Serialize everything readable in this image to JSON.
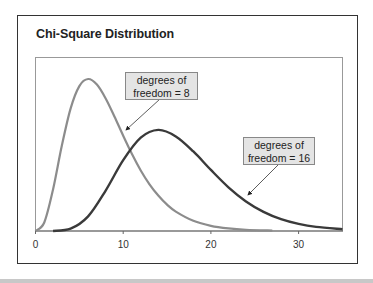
{
  "figure": {
    "title": "Chi-Square Distribution"
  },
  "callouts": [
    {
      "line1": "degrees of",
      "line2": "freedom = 8"
    },
    {
      "line1": "degrees of",
      "line2": "freedom = 16"
    }
  ],
  "colors": {
    "df8_line": "#8c8c8c",
    "df16_line": "#3a3a3a",
    "callout_bg": "#e4e4e4",
    "axis": "#666666"
  },
  "chart_data": {
    "type": "line",
    "title": "Chi-Square Distribution",
    "xlabel": "",
    "ylabel": "",
    "xlim": [
      0,
      35
    ],
    "x_ticks": [
      0,
      10,
      20,
      30
    ],
    "x_tick_labels": [
      "0",
      "10",
      "20",
      "30"
    ],
    "grid": false,
    "legend": "callout annotations",
    "series": [
      {
        "name": "degrees of freedom = 8",
        "color": "#8c8c8c",
        "x": [
          0,
          1,
          2,
          3,
          4,
          5,
          6,
          7,
          8,
          9,
          10,
          11,
          12,
          13,
          14,
          15,
          16,
          18,
          20,
          22,
          24,
          27
        ],
        "y": [
          0,
          0.0063,
          0.0306,
          0.0628,
          0.0902,
          0.1068,
          0.112,
          0.1079,
          0.0977,
          0.0844,
          0.0702,
          0.0567,
          0.0446,
          0.0344,
          0.0261,
          0.0194,
          0.0143,
          0.0075,
          0.0038,
          0.0019,
          0.0009,
          0.0003
        ]
      },
      {
        "name": "degrees of freedom = 16",
        "color": "#3a3a3a",
        "x": [
          2,
          4,
          6,
          8,
          10,
          12,
          14,
          16,
          18,
          20,
          22,
          24,
          26,
          28,
          30,
          32,
          35
        ],
        "y": [
          0.0,
          0.0017,
          0.0108,
          0.0298,
          0.0522,
          0.0688,
          0.0745,
          0.0697,
          0.0586,
          0.045,
          0.0322,
          0.0218,
          0.0141,
          0.0087,
          0.0052,
          0.003,
          0.0013
        ]
      }
    ],
    "annotations": [
      {
        "text": "degrees of freedom = 8",
        "points_to_x": 10
      },
      {
        "text": "degrees of freedom = 16",
        "points_to_x": 24
      }
    ]
  }
}
